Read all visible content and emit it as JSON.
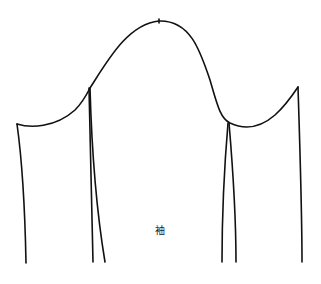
{
  "diagram": {
    "type": "sewing-pattern",
    "piece": "sleeve",
    "label": "袖",
    "stroke_color": "#111111",
    "background": "#ffffff",
    "crown_notch": {
      "x": 159,
      "y": 21
    },
    "outline_points": {
      "left_corner": {
        "x": 17,
        "y": 124
      },
      "left_seam_top": {
        "x": 90,
        "y": 88
      },
      "crown_peak": {
        "x": 159,
        "y": 21
      },
      "right_underarm": {
        "x": 228,
        "y": 123
      },
      "right_corner": {
        "x": 298,
        "y": 87
      }
    },
    "bottom_y": 262
  }
}
